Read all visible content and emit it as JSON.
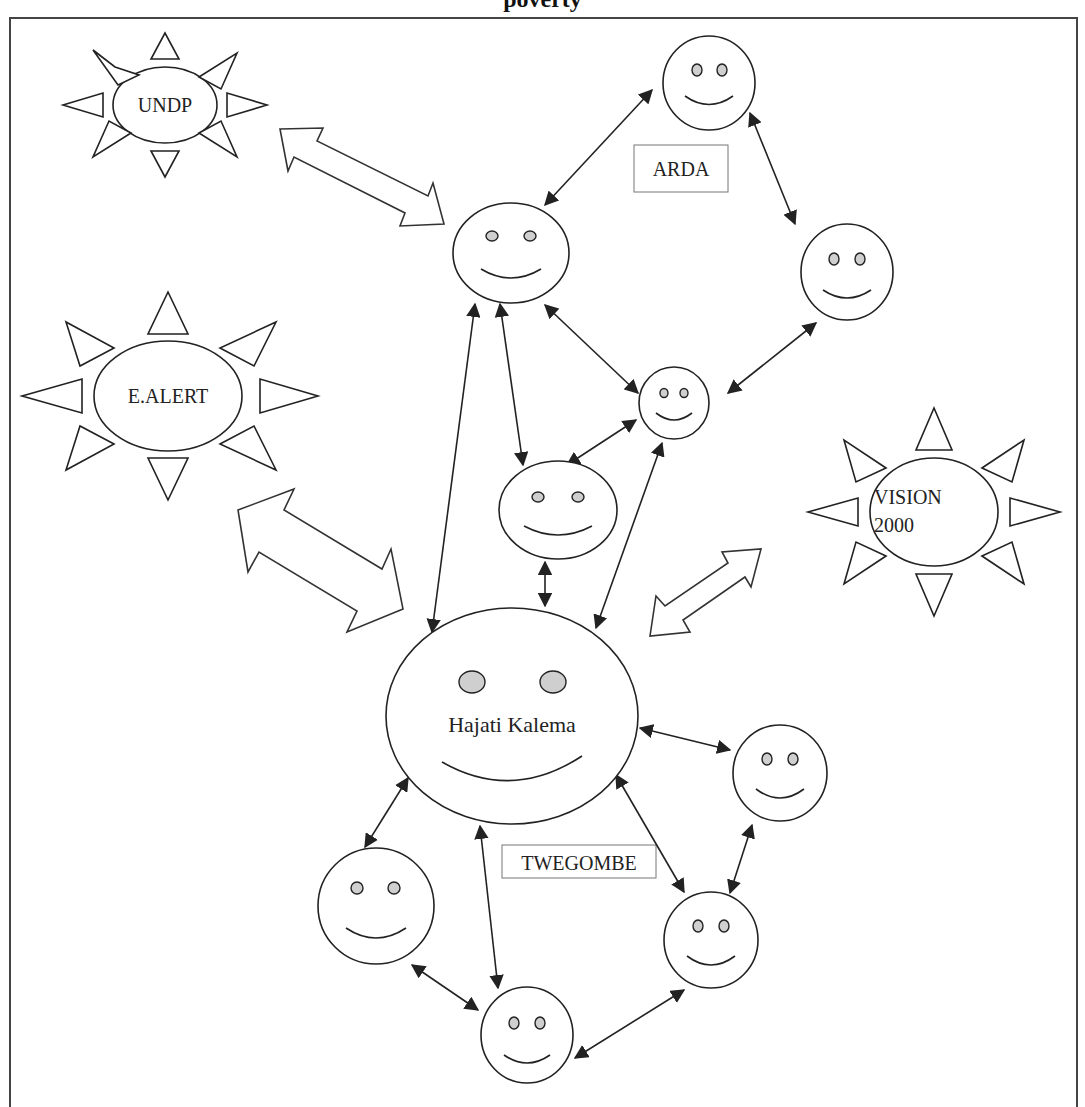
{
  "title": "poverty",
  "organizations": [
    {
      "id": "undp",
      "label_lines": [
        "UNDP"
      ]
    },
    {
      "id": "e-alert",
      "label_lines": [
        "E.ALERT"
      ]
    },
    {
      "id": "vision-2000",
      "label_lines": [
        "VISION",
        "2000"
      ]
    }
  ],
  "group_labels": {
    "arda": "ARDA",
    "twegombe": "TWEGOMBE"
  },
  "central_person": {
    "name": "Hajati Kalema"
  },
  "colors": {
    "stroke": "#222222",
    "eye_fill": "#cfcfcf",
    "background": "#ffffff"
  }
}
